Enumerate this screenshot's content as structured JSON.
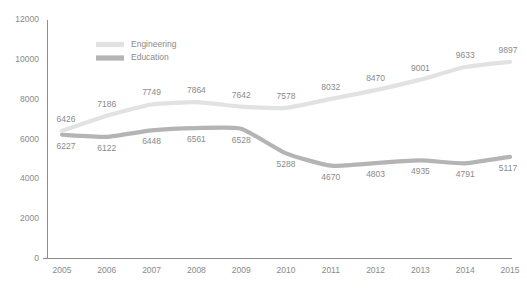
{
  "chart_data": {
    "type": "line",
    "title": "",
    "xlabel": "",
    "ylabel": "",
    "categories": [
      "2005",
      "2006",
      "2007",
      "2008",
      "2009",
      "2010",
      "2011",
      "2012",
      "2013",
      "2014",
      "2015"
    ],
    "x": [
      2005,
      2006,
      2007,
      2008,
      2009,
      2010,
      2011,
      2012,
      2013,
      2014,
      2015
    ],
    "series": [
      {
        "name": "Engineering",
        "color": "#e2e2e2",
        "values": [
          6426,
          7186,
          7749,
          7864,
          7642,
          7578,
          8032,
          8470,
          9001,
          9633,
          9897
        ],
        "labels": [
          "6426",
          "7186",
          "7749",
          "7864",
          "7642",
          "7578",
          "8032",
          "8470",
          "9001",
          "9633",
          "9897"
        ]
      },
      {
        "name": "Education",
        "color": "#b4b4b4",
        "values": [
          6227,
          6122,
          6448,
          6561,
          6528,
          5288,
          4670,
          4803,
          4935,
          4791,
          5117
        ],
        "labels": [
          "6227",
          "6122",
          "6448",
          "6561",
          "6528",
          "5288",
          "4670",
          "4803",
          "4935",
          "4791",
          "5117"
        ]
      }
    ],
    "ylim": [
      0,
      12000
    ],
    "yticks": [
      0,
      2000,
      4000,
      6000,
      8000,
      10000,
      12000
    ],
    "ytick_labels": [
      "0",
      "2000",
      "4000",
      "6000",
      "8000",
      "10000",
      "12000"
    ],
    "grid": false,
    "legend_position": "top-left",
    "axis_color": "#8c8c8c",
    "text_color": "#8a8a8a",
    "background": "#ffffff"
  },
  "legend": {
    "entries": [
      {
        "label": "Engineering",
        "color": "#e2e2e2"
      },
      {
        "label": "Education",
        "color": "#b4b4b4"
      }
    ]
  }
}
